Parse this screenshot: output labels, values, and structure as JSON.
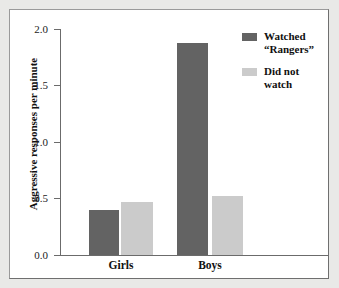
{
  "chart_data": {
    "type": "bar",
    "title": "",
    "xlabel": "",
    "ylabel": "Aggressive responses per minute",
    "ylim": [
      0.0,
      2.0
    ],
    "ytick_labels": [
      "2.0",
      "1.5",
      "1.0",
      "0.5",
      "0.0"
    ],
    "ytick_values": [
      2.0,
      1.5,
      1.0,
      0.5,
      0.0
    ],
    "grid": false,
    "legend_position": "top-right",
    "categories": [
      "Girls",
      "Boys"
    ],
    "series": [
      {
        "name": "Watched “Rangers”",
        "color": "#636363",
        "values": [
          0.4,
          1.88
        ]
      },
      {
        "name": "Did not watch",
        "color": "#cbcbcb",
        "values": [
          0.47,
          0.52
        ]
      }
    ]
  },
  "legend": {
    "entries": [
      {
        "line1": "Watched",
        "line2": "“Rangers”",
        "swatch": "dark-swatch-icon"
      },
      {
        "line1": "Did not",
        "line2": "watch",
        "swatch": "light-swatch-icon"
      }
    ]
  },
  "axes": {
    "y_title": "Aggressive responses per minute",
    "y_ticks": [
      "2.0",
      "1.5",
      "1.0",
      "0.5",
      "0.0"
    ],
    "x_categories": [
      "Girls",
      "Boys"
    ]
  }
}
